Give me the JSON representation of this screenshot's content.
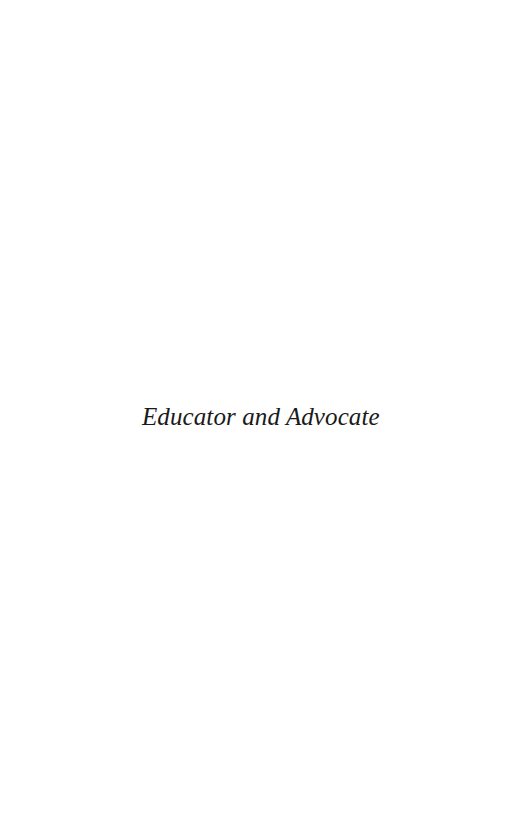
{
  "page": {
    "type": "half-title",
    "title": "Educator and Advocate",
    "text_color": "#1a1a1a",
    "background_color": "#ffffff"
  }
}
